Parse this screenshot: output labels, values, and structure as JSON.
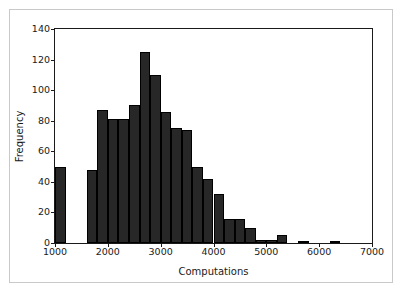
{
  "chart_data": {
    "type": "bar",
    "title": "",
    "subtitle": "",
    "xlabel": "Computations",
    "ylabel": "Frequency",
    "xlim": [
      1000,
      7000
    ],
    "ylim": [
      0,
      140
    ],
    "xticks": [
      1000,
      2000,
      3000,
      4000,
      5000,
      6000,
      7000
    ],
    "yticks": [
      0,
      20,
      40,
      60,
      80,
      100,
      120,
      140
    ],
    "xtick_labels": [
      "1000",
      "2000",
      "3000",
      "4000",
      "5000",
      "6000",
      "7000"
    ],
    "ytick_labels": [
      "0",
      "20",
      "40",
      "60",
      "80",
      "100",
      "120",
      "140"
    ],
    "grid": false,
    "legend": null,
    "bin_width": 200,
    "bar_color": "#272727",
    "bar_edge_color": "#000000",
    "bins": [
      {
        "x0": 1000,
        "x1": 1200,
        "value": 50
      },
      {
        "x0": 1200,
        "x1": 1400,
        "value": 0
      },
      {
        "x0": 1400,
        "x1": 1600,
        "value": 0
      },
      {
        "x0": 1600,
        "x1": 1800,
        "value": 48
      },
      {
        "x0": 1800,
        "x1": 2000,
        "value": 87
      },
      {
        "x0": 2000,
        "x1": 2200,
        "value": 81
      },
      {
        "x0": 2200,
        "x1": 2400,
        "value": 81
      },
      {
        "x0": 2400,
        "x1": 2600,
        "value": 90
      },
      {
        "x0": 2600,
        "x1": 2800,
        "value": 125
      },
      {
        "x0": 2800,
        "x1": 3000,
        "value": 110
      },
      {
        "x0": 3000,
        "x1": 3200,
        "value": 86
      },
      {
        "x0": 3200,
        "x1": 3400,
        "value": 75
      },
      {
        "x0": 3400,
        "x1": 3600,
        "value": 74
      },
      {
        "x0": 3600,
        "x1": 3800,
        "value": 50
      },
      {
        "x0": 3800,
        "x1": 4000,
        "value": 42
      },
      {
        "x0": 4000,
        "x1": 4200,
        "value": 32
      },
      {
        "x0": 4200,
        "x1": 4400,
        "value": 16
      },
      {
        "x0": 4400,
        "x1": 4600,
        "value": 16
      },
      {
        "x0": 4600,
        "x1": 4800,
        "value": 10
      },
      {
        "x0": 4800,
        "x1": 5000,
        "value": 2
      },
      {
        "x0": 5000,
        "x1": 5200,
        "value": 2
      },
      {
        "x0": 5200,
        "x1": 5400,
        "value": 5
      },
      {
        "x0": 5400,
        "x1": 5600,
        "value": 0
      },
      {
        "x0": 5600,
        "x1": 5800,
        "value": 1
      },
      {
        "x0": 5800,
        "x1": 6000,
        "value": 0
      },
      {
        "x0": 6000,
        "x1": 6200,
        "value": 0
      },
      {
        "x0": 6200,
        "x1": 6400,
        "value": 1
      }
    ]
  }
}
